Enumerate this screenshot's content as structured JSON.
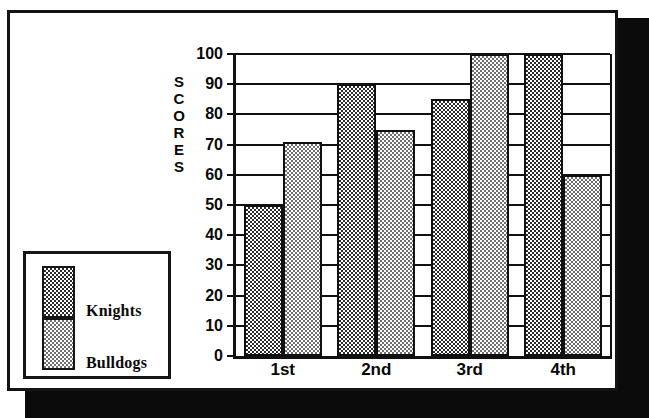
{
  "chart_data": {
    "type": "bar",
    "title": "",
    "xlabel": "",
    "ylabel": "SCORES",
    "categories": [
      "1st",
      "2nd",
      "3rd",
      "4th"
    ],
    "ylim": [
      0,
      100
    ],
    "ytick_labels": [
      "0",
      "10",
      "20",
      "30",
      "40",
      "50",
      "60",
      "70",
      "80",
      "90",
      "100"
    ],
    "ytick_values": [
      0,
      10,
      20,
      30,
      40,
      50,
      60,
      70,
      80,
      90,
      100
    ],
    "grid": true,
    "legend_position": "left-outside",
    "series": [
      {
        "name": "Knights",
        "values": [
          50,
          90,
          85,
          100
        ],
        "fill": "dark-checker",
        "color": "#2b2b2b"
      },
      {
        "name": "Bulldogs",
        "values": [
          71,
          75,
          100,
          60
        ],
        "fill": "light-checker",
        "color": "#6f6f6f"
      }
    ]
  },
  "axis": {
    "y_title_letters": [
      "S",
      "C",
      "O",
      "R",
      "E",
      "S"
    ]
  },
  "colors": {
    "frame": "#131313",
    "shadow": "#0b0b0b",
    "axis": "#111111",
    "background": "#ffffff"
  }
}
